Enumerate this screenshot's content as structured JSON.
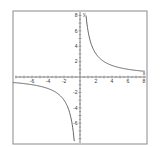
{
  "chart_data": {
    "type": "line",
    "title": "",
    "function": "y = 6/x",
    "xlabel": "x",
    "ylabel": "y",
    "xlim": [
      -8,
      8
    ],
    "ylim": [
      -8,
      8
    ],
    "grid": false,
    "x_ticks": [
      -6,
      -4,
      -2,
      2,
      4,
      6,
      8
    ],
    "y_ticks": [
      8,
      6,
      4,
      2,
      -2,
      -4,
      -6
    ],
    "series": [
      {
        "name": "branch-positive",
        "points": [
          [
            0.75,
            8
          ],
          [
            1,
            6
          ],
          [
            1.5,
            4
          ],
          [
            2,
            3
          ],
          [
            3,
            2
          ],
          [
            4,
            1.5
          ],
          [
            6,
            1
          ],
          [
            8,
            0.75
          ]
        ]
      },
      {
        "name": "branch-negative",
        "points": [
          [
            -8,
            -0.75
          ],
          [
            -6,
            -1
          ],
          [
            -4,
            -1.5
          ],
          [
            -3,
            -2
          ],
          [
            -2,
            -3
          ],
          [
            -1.5,
            -4
          ],
          [
            -1,
            -6
          ],
          [
            -0.75,
            -8
          ]
        ]
      }
    ],
    "colors": {
      "curve": "#555555",
      "axes": "#666666",
      "frame": "#888888"
    }
  }
}
